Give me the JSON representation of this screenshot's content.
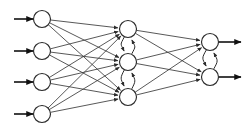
{
  "diagram": {
    "type": "neural-network-graph",
    "background_color": "#ffffff",
    "node_fill_color": "#ffffff",
    "node_stroke_color": "#2b2b2b",
    "edge_color": "#3a3a3a",
    "io_arrow_color": "#111111",
    "node_radius": 8.5,
    "layers": [
      {
        "name": "input-layer",
        "label": "Input layer",
        "node_count": 4,
        "nodes": [
          {
            "id": "i1",
            "cx": 42,
            "cy": 19,
            "label": ""
          },
          {
            "id": "i2",
            "cx": 42,
            "cy": 51,
            "label": ""
          },
          {
            "id": "i3",
            "cx": 42,
            "cy": 82,
            "label": ""
          },
          {
            "id": "i4",
            "cx": 42,
            "cy": 114,
            "label": ""
          }
        ]
      },
      {
        "name": "hidden-layer",
        "label": "Hidden layer",
        "node_count": 3,
        "nodes": [
          {
            "id": "h1",
            "cx": 128,
            "cy": 29,
            "label": ""
          },
          {
            "id": "h2",
            "cx": 128,
            "cy": 62,
            "label": ""
          },
          {
            "id": "h3",
            "cx": 128,
            "cy": 97,
            "label": ""
          }
        ]
      },
      {
        "name": "output-layer",
        "label": "Output layer",
        "node_count": 2,
        "nodes": [
          {
            "id": "o1",
            "cx": 210,
            "cy": 42,
            "label": ""
          },
          {
            "id": "o2",
            "cx": 210,
            "cy": 77,
            "label": ""
          }
        ]
      }
    ],
    "input_arrows": [
      {
        "id": "in1",
        "x1": 14,
        "y1": 19,
        "x2": 33,
        "y2": 19
      },
      {
        "id": "in2",
        "x1": 14,
        "y1": 51,
        "x2": 33,
        "y2": 51
      },
      {
        "id": "in3",
        "x1": 14,
        "y1": 82,
        "x2": 33,
        "y2": 82
      },
      {
        "id": "in4",
        "x1": 14,
        "y1": 114,
        "x2": 33,
        "y2": 114
      }
    ],
    "output_arrows": [
      {
        "id": "out1",
        "x1": 219,
        "y1": 42,
        "x2": 241,
        "y2": 42
      },
      {
        "id": "out2",
        "x1": 219,
        "y1": 77,
        "x2": 241,
        "y2": 77
      }
    ],
    "connections_input_hidden": [
      {
        "from": "i1",
        "to": "h1"
      },
      {
        "from": "i1",
        "to": "h2"
      },
      {
        "from": "i1",
        "to": "h3"
      },
      {
        "from": "i2",
        "to": "h1"
      },
      {
        "from": "i2",
        "to": "h2"
      },
      {
        "from": "i2",
        "to": "h3"
      },
      {
        "from": "i3",
        "to": "h1"
      },
      {
        "from": "i3",
        "to": "h2"
      },
      {
        "from": "i3",
        "to": "h3"
      },
      {
        "from": "i4",
        "to": "h1"
      },
      {
        "from": "i4",
        "to": "h2"
      },
      {
        "from": "i4",
        "to": "h3"
      }
    ],
    "connections_hidden_output": [
      {
        "from": "h1",
        "to": "o1"
      },
      {
        "from": "h1",
        "to": "o2"
      },
      {
        "from": "h2",
        "to": "o1"
      },
      {
        "from": "h2",
        "to": "o2"
      },
      {
        "from": "h3",
        "to": "o1"
      },
      {
        "from": "h3",
        "to": "o2"
      }
    ],
    "recurrent_connections_hidden": [
      {
        "from": "h1",
        "to": "h2",
        "direction": "down"
      },
      {
        "from": "h2",
        "to": "h1",
        "direction": "up"
      },
      {
        "from": "h2",
        "to": "h3",
        "direction": "down"
      },
      {
        "from": "h3",
        "to": "h2",
        "direction": "up"
      }
    ],
    "recurrent_connections_output": [
      {
        "from": "o1",
        "to": "o2",
        "direction": "down"
      },
      {
        "from": "o2",
        "to": "o1",
        "direction": "up"
      }
    ]
  }
}
